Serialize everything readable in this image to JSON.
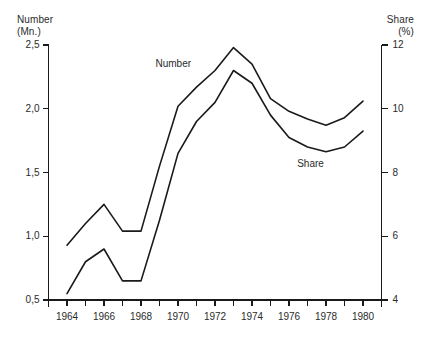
{
  "chart_data": {
    "type": "line",
    "title": "",
    "subtitle": "",
    "xlabel": "",
    "ylabel": "Number (Mn.)",
    "y2label": "Share (%)",
    "grid": false,
    "legend_position": "inline-labels",
    "x": [
      1964,
      1965,
      1966,
      1967,
      1968,
      1969,
      1970,
      1971,
      1972,
      1973,
      1974,
      1975,
      1976,
      1977,
      1978,
      1979,
      1980
    ],
    "xlim": [
      1963,
      1981
    ],
    "xticks": [
      1963,
      1964,
      1965,
      1966,
      1967,
      1968,
      1969,
      1970,
      1971,
      1972,
      1973,
      1974,
      1975,
      1976,
      1977,
      1978,
      1979,
      1980,
      1981
    ],
    "xtick_labels": [
      "1964",
      "1966",
      "1968",
      "1970",
      "1972",
      "1974",
      "1976",
      "1978",
      "1980"
    ],
    "xtick_label_values": [
      1964,
      1966,
      1968,
      1970,
      1972,
      1974,
      1976,
      1978,
      1980
    ],
    "ylim": [
      0.5,
      2.5
    ],
    "yticks": [
      0.5,
      1.0,
      1.5,
      2.0,
      2.5
    ],
    "ytick_labels": [
      "0,5",
      "1,0",
      "1,5",
      "2,0",
      "2,5"
    ],
    "y2lim": [
      4,
      12
    ],
    "y2ticks": [
      4,
      6,
      8,
      10,
      12
    ],
    "y2tick_labels": [
      "4",
      "6",
      "8",
      "10",
      "12"
    ],
    "series": [
      {
        "name": "Number",
        "axis": "left",
        "unit": "Mn.",
        "label_text": "Number",
        "values": [
          0.93,
          1.1,
          1.25,
          1.04,
          1.04,
          1.55,
          2.02,
          2.17,
          2.3,
          2.48,
          2.35,
          2.08,
          1.98,
          1.92,
          1.87,
          1.93,
          2.06
        ]
      },
      {
        "name": "Share",
        "axis": "right",
        "unit": "%",
        "label_text": "Share",
        "values": [
          4.2,
          5.2,
          5.6,
          4.6,
          4.6,
          6.5,
          8.6,
          9.6,
          10.2,
          11.2,
          10.8,
          9.8,
          9.1,
          8.8,
          8.65,
          8.8,
          9.3
        ]
      }
    ],
    "colors": {
      "line": "#1a1a1a",
      "text": "#2b2b2b",
      "background": "#ffffff"
    }
  },
  "axes": {
    "left_title_line1": "Number",
    "left_title_line2": "(Mn.)",
    "right_title_line1": "Share",
    "right_title_line2": "(%)"
  },
  "labels": {
    "number_series": "Number",
    "share_series": "Share"
  }
}
